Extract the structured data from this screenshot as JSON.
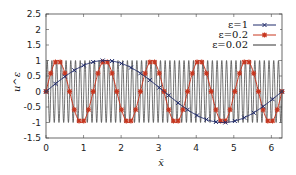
{
  "chart_data": {
    "type": "line",
    "title": "",
    "xlabel": "x̄",
    "ylabel": "u^ε",
    "xlim": [
      0,
      6.2832
    ],
    "ylim": [
      -1.5,
      2.5
    ],
    "xticks": [
      "0",
      "1",
      "2",
      "3",
      "4",
      "5",
      "6"
    ],
    "yticks": [
      "-1.5",
      "-1",
      "-0.5",
      "0",
      "0.5",
      "1",
      "1.5",
      "2",
      "2.5"
    ],
    "grid": false,
    "legend_position": "upper right",
    "series": [
      {
        "name": "ε=1",
        "function": "sin(x/1)",
        "color": "#1f2a6b",
        "marker": "x",
        "n_markers": 25
      },
      {
        "name": "ε=0.2",
        "function": "sin(x/0.2)",
        "color": "#c8361f",
        "marker": "*",
        "n_markers": 50
      },
      {
        "name": "ε=0.02",
        "function": "sin(x/0.02)",
        "color": "#333333",
        "marker": "none"
      }
    ]
  },
  "legend": {
    "items": [
      "ε=1",
      "ε=0.2",
      "ε=0.02"
    ]
  }
}
